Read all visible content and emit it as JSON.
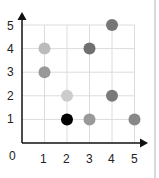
{
  "chart_data": {
    "type": "scatter",
    "title": "",
    "xlabel": "",
    "ylabel": "",
    "xlim": [
      0,
      5
    ],
    "ylim": [
      0,
      5
    ],
    "grid": true,
    "origin_label": "0",
    "x_ticks": [
      "1",
      "2",
      "3",
      "4",
      "5"
    ],
    "y_ticks": [
      "1",
      "2",
      "3",
      "4",
      "5"
    ],
    "points": [
      {
        "x": 4,
        "y": 5,
        "color": "#777777"
      },
      {
        "x": 1,
        "y": 4,
        "color": "#bbbbbb"
      },
      {
        "x": 3,
        "y": 4,
        "color": "#707070"
      },
      {
        "x": 1,
        "y": 3,
        "color": "#999999"
      },
      {
        "x": 2,
        "y": 2,
        "color": "#cccccc"
      },
      {
        "x": 4,
        "y": 2,
        "color": "#7a7a7a"
      },
      {
        "x": 2,
        "y": 1,
        "color": "#000000"
      },
      {
        "x": 3,
        "y": 1,
        "color": "#999999"
      },
      {
        "x": 5,
        "y": 1,
        "color": "#888888"
      }
    ]
  }
}
